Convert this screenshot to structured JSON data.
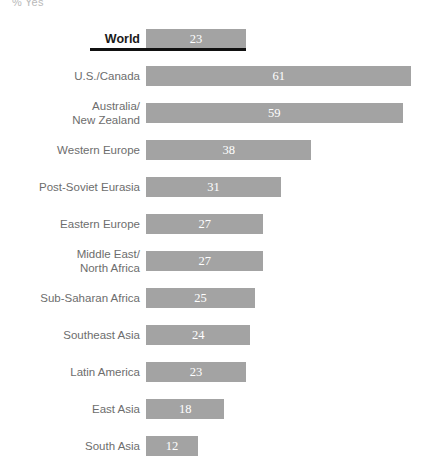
{
  "axis_caption": "% Yes",
  "chart_data": {
    "type": "bar",
    "orientation": "horizontal",
    "title": "",
    "subtitle": "",
    "xlabel": "% Yes",
    "ylabel": "",
    "xlim": [
      0,
      64
    ],
    "grid": false,
    "legend": false,
    "categories": [
      "World",
      "U.S./Canada",
      "Australia/\nNew Zealand",
      "Western Europe",
      "Post-Soviet Eurasia",
      "Eastern Europe",
      "Middle East/\nNorth Africa",
      "Sub-Saharan Africa",
      "Southeast Asia",
      "Latin America",
      "East Asia",
      "South Asia"
    ],
    "values": [
      23,
      61,
      59,
      38,
      31,
      27,
      27,
      25,
      24,
      23,
      18,
      12
    ],
    "bar_color": "#a3a3a3",
    "value_label_color": "#ffffff",
    "highlight_row": "World",
    "highlight_rule_color": "#111111",
    "rows": [
      {
        "label": "World",
        "value": 23,
        "value_text": "23",
        "highlight": true
      },
      {
        "label": "U.S./Canada",
        "value": 61,
        "value_text": "61",
        "highlight": false
      },
      {
        "label": "Australia/\nNew Zealand",
        "value": 59,
        "value_text": "59",
        "highlight": false
      },
      {
        "label": "Western Europe",
        "value": 38,
        "value_text": "38",
        "highlight": false
      },
      {
        "label": "Post-Soviet Eurasia",
        "value": 31,
        "value_text": "31",
        "highlight": false
      },
      {
        "label": "Eastern Europe",
        "value": 27,
        "value_text": "27",
        "highlight": false
      },
      {
        "label": "Middle East/\nNorth Africa",
        "value": 27,
        "value_text": "27",
        "highlight": false
      },
      {
        "label": "Sub-Saharan Africa",
        "value": 25,
        "value_text": "25",
        "highlight": false
      },
      {
        "label": "Southeast Asia",
        "value": 24,
        "value_text": "24",
        "highlight": false
      },
      {
        "label": "Latin America",
        "value": 23,
        "value_text": "23",
        "highlight": false
      },
      {
        "label": "East Asia",
        "value": 18,
        "value_text": "18",
        "highlight": false
      },
      {
        "label": "South Asia",
        "value": 12,
        "value_text": "12",
        "highlight": false
      }
    ]
  },
  "layout": {
    "bar_origin_x": 146,
    "px_per_unit": 4.35
  }
}
